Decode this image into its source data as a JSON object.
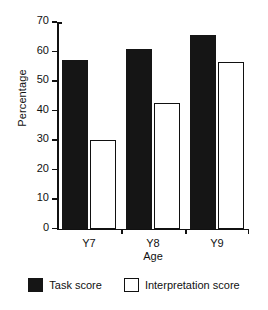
{
  "chart_data": {
    "type": "bar",
    "title": "",
    "xlabel": "Age",
    "ylabel": "Percentage",
    "categories": [
      "Y7",
      "Y8",
      "Y9"
    ],
    "series": [
      {
        "name": "Task score",
        "values": [
          57,
          61,
          65.5
        ],
        "color": "#151515",
        "style": "filled"
      },
      {
        "name": "Interpretation score",
        "values": [
          30,
          42.5,
          56.5
        ],
        "color": "#ffffff",
        "style": "outlined"
      }
    ],
    "ylim": [
      0,
      70
    ],
    "ytick_labels": [
      "0",
      "10",
      "20",
      "30",
      "40",
      "50",
      "60",
      "70"
    ],
    "ytick_values": [
      0,
      10,
      20,
      30,
      40,
      50,
      60,
      70
    ],
    "grid": false,
    "legend_position": "bottom"
  },
  "axes": {
    "y_title": "Percentage",
    "x_title": "Age"
  },
  "legend": {
    "entries": [
      {
        "label": "Task score",
        "swatch": "filled-black-square"
      },
      {
        "label": "Interpretation score",
        "swatch": "outlined-white-square"
      }
    ]
  }
}
